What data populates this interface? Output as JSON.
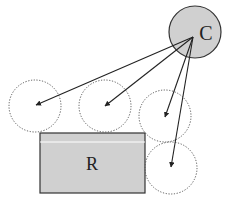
{
  "diagram": {
    "source_label": "C",
    "rect_label": "R",
    "colors": {
      "fill": "#d0d0d0",
      "stroke": "#333333",
      "dotted": "#555555",
      "background": "#ffffff"
    },
    "target_circle_count": 4,
    "arrow_count": 4
  }
}
